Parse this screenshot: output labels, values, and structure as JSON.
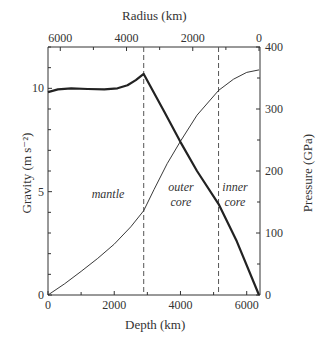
{
  "chart_data": {
    "type": "line",
    "title": "",
    "xlabel": "Depth (km)",
    "x2label": "Radius (km)",
    "ylabel": "Gravity (m s⁻²)",
    "y2label": "Pressure (GPa)",
    "xlim": [
      0,
      6371
    ],
    "ylim": [
      0,
      12
    ],
    "y2lim": [
      0,
      400
    ],
    "x_ticks": [
      0,
      2000,
      4000,
      6000
    ],
    "x_minor_ticks": [
      1000,
      3000,
      5000
    ],
    "x2_ticks": [
      6000,
      4000,
      2000,
      0
    ],
    "y_ticks": [
      0,
      5,
      10
    ],
    "y2_ticks": [
      0,
      100,
      200,
      300,
      400
    ],
    "grid": false,
    "boundaries": [
      {
        "name": "core-mantle boundary",
        "depth": 2890
      },
      {
        "name": "inner-core boundary",
        "depth": 5150
      }
    ],
    "regions": [
      {
        "label": [
          "mantle"
        ],
        "depth_center": 1500
      },
      {
        "label": [
          "outer",
          "core"
        ],
        "depth_center": 4000
      },
      {
        "label": [
          "inner",
          "core"
        ],
        "depth_center": 5750
      }
    ],
    "series": [
      {
        "name": "Gravity",
        "axis": "left",
        "style": "thick",
        "x": [
          0,
          300,
          700,
          1200,
          1700,
          2100,
          2400,
          2650,
          2890,
          3500,
          4000,
          4500,
          5150,
          5700,
          6371
        ],
        "values": [
          9.82,
          9.95,
          10.0,
          9.97,
          9.95,
          10.0,
          10.15,
          10.4,
          10.7,
          8.9,
          7.4,
          6.0,
          4.4,
          2.6,
          0.0
        ]
      },
      {
        "name": "Pressure",
        "axis": "right",
        "style": "thin",
        "x": [
          0,
          500,
          1000,
          1500,
          2000,
          2500,
          2890,
          3200,
          3600,
          4000,
          4500,
          5150,
          5600,
          6000,
          6371
        ],
        "values": [
          0,
          18,
          38,
          59,
          82,
          110,
          136,
          170,
          212,
          248,
          290,
          330,
          348,
          359,
          363
        ]
      }
    ]
  },
  "labels": {
    "x_axis_title": "Depth (km)",
    "x2_axis_title": "Radius (km)",
    "y_axis_title": "Gravity (m s⁻²)",
    "y2_axis_title": "Pressure (GPa)",
    "mantle": "mantle",
    "outer_1": "outer",
    "outer_2": "core",
    "inner_1": "inner",
    "inner_2": "core"
  }
}
